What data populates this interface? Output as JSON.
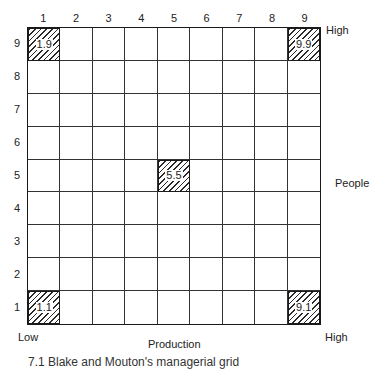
{
  "diagram": {
    "type": "grid",
    "x_axis": {
      "label": "Production",
      "low": "Low",
      "high": "High",
      "ticks": [
        "1",
        "2",
        "3",
        "4",
        "5",
        "6",
        "7",
        "8",
        "9"
      ]
    },
    "y_axis": {
      "label": "People",
      "high": "High",
      "ticks": [
        "9",
        "8",
        "7",
        "6",
        "5",
        "4",
        "3",
        "2",
        "1"
      ]
    },
    "highlighted": [
      {
        "label": "1.9",
        "x": 1,
        "y": 9
      },
      {
        "label": "9.9",
        "x": 9,
        "y": 9
      },
      {
        "label": "5.5",
        "x": 5,
        "y": 5
      },
      {
        "label": "1.1",
        "x": 1,
        "y": 1
      },
      {
        "label": "9.1",
        "x": 9,
        "y": 1
      }
    ],
    "caption": "7.1  Blake and Mouton's managerial grid"
  }
}
